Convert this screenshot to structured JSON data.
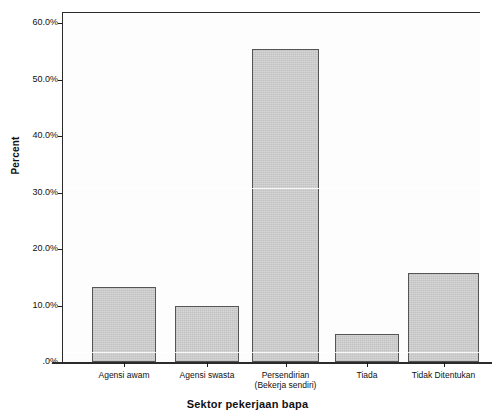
{
  "chart_data": {
    "type": "bar",
    "title": "",
    "xlabel": "Sektor pekerjaan bapa",
    "ylabel": "Percent",
    "categories": [
      "Agensi awam",
      "Agensi swasta",
      "Persendirian\n(Bekerja sendiri)",
      "Tiada",
      "Tidak Ditentukan"
    ],
    "values": [
      13.2,
      10.0,
      55.4,
      5.0,
      15.8
    ],
    "ylim": [
      0,
      63
    ],
    "ytick_values": [
      0,
      10,
      20,
      30,
      40,
      50,
      60
    ],
    "ytick_labels": [
      ".0%",
      "10.0%",
      "20.0%",
      "30.0%",
      "40.0%",
      "50.0%",
      "60.0%"
    ],
    "grid": false,
    "legend": false,
    "bar_color": "#d2d2d2",
    "bar_edge_color": "#555555",
    "axis_color": "#2b2b2b",
    "background_color": "#ffffff"
  }
}
